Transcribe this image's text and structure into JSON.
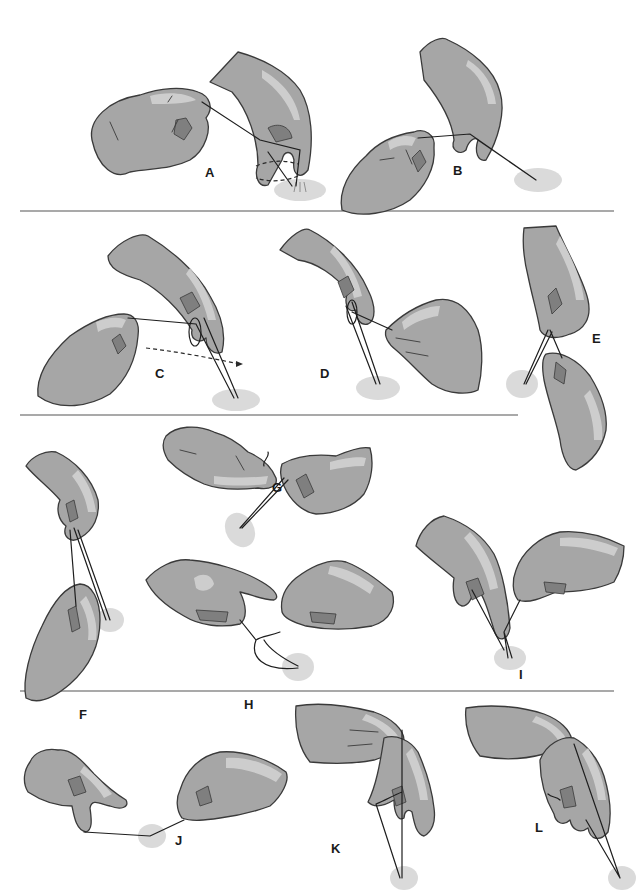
{
  "figure": {
    "panels": [
      {
        "id": "A",
        "label": "A",
        "row": 1
      },
      {
        "id": "B",
        "label": "B",
        "row": 1
      },
      {
        "id": "C",
        "label": "C",
        "row": 2
      },
      {
        "id": "D",
        "label": "D",
        "row": 2
      },
      {
        "id": "E",
        "label": "E",
        "row": 2
      },
      {
        "id": "F",
        "label": "F",
        "row": 3
      },
      {
        "id": "G",
        "label": "G",
        "row": 3
      },
      {
        "id": "H",
        "label": "H",
        "row": 3
      },
      {
        "id": "I",
        "label": "I",
        "row": 3
      },
      {
        "id": "J",
        "label": "J",
        "row": 4
      },
      {
        "id": "K",
        "label": "K",
        "row": 4
      },
      {
        "id": "L",
        "label": "L",
        "row": 4
      }
    ],
    "colors": {
      "glove": "#a6a6a6",
      "glove_highlight": "#d2d2d2",
      "glove_shadow": "#7f7f7f",
      "outline": "#3a3a3a",
      "suture": "#1e1e1e",
      "tissue": "#d4d4d4",
      "divider": "#8c8c8c",
      "background": "#ffffff"
    }
  }
}
